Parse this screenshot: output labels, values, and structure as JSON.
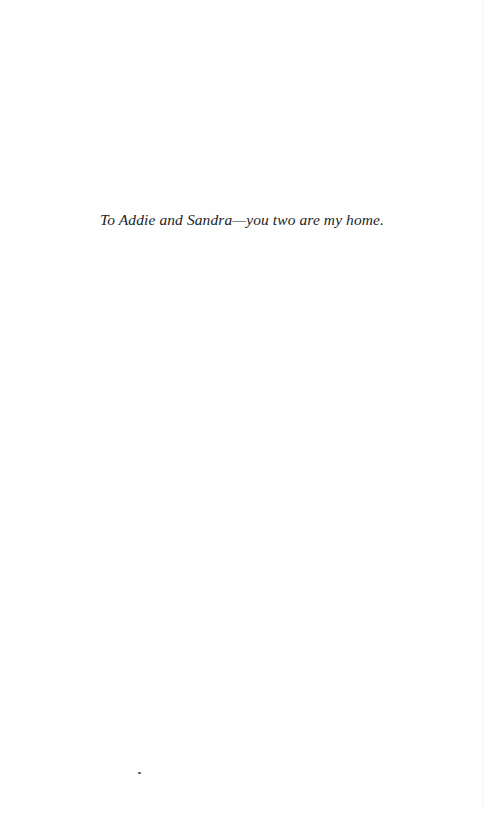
{
  "page": {
    "type": "dedication",
    "dedication_text": "To Addie and Sandra—you two are my home."
  },
  "colors": {
    "background": "#fefefe",
    "text": "#1e1e1e"
  }
}
